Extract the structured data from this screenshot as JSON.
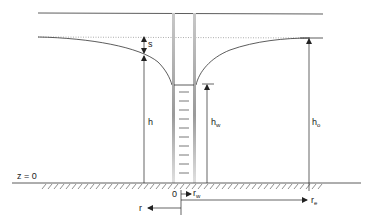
{
  "diagram": {
    "labels": {
      "s": "s",
      "h": "h",
      "hw_main": "h",
      "hw_sub": "w",
      "ho_main": "h",
      "ho_sub": "o",
      "datum": "z = 0",
      "origin": "0",
      "rw_main": "r",
      "rw_sub": "w",
      "re_main": "r",
      "re_sub": "e",
      "r": "r"
    },
    "colors": {
      "line": "#333333",
      "well_wall": "#bdbdbd",
      "dotted": "#888888",
      "background": "#ffffff"
    }
  }
}
